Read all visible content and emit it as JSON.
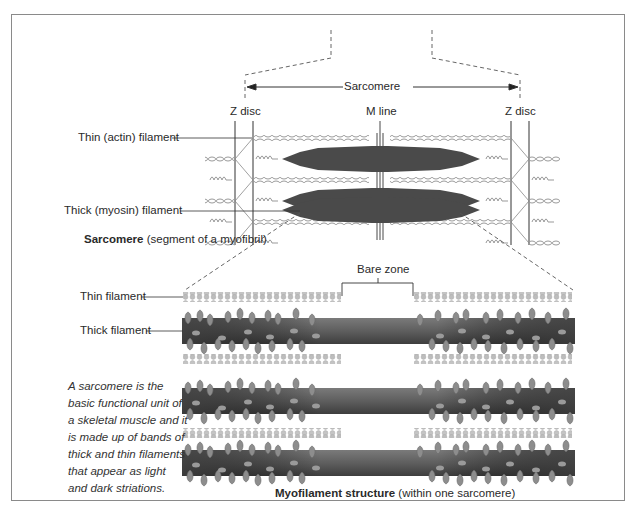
{
  "sarcomere_diagram": {
    "span_label": "Sarcomere",
    "z_disc_left": "Z disc",
    "z_disc_right": "Z disc",
    "m_line": "M line",
    "thin_label": "Thin (actin) filament",
    "thick_label": "Thick (myosin) filament",
    "caption_bold": "Sarcomere",
    "caption_rest": " (segment of a myofibril)"
  },
  "myofilament_diagram": {
    "bare_zone": "Bare zone",
    "thin_label": "Thin filament",
    "thick_label": "Thick filament",
    "caption_bold": "Myofilament structure",
    "caption_rest": " (within one sarcomere)"
  },
  "note": "A sarcomere is the basic functional unit of a skeletal muscle and it is made up of bands of thick and thin filaments that appear as light and dark striations.",
  "colors": {
    "frame": "#8a8a8a",
    "thick_dark": "#4a4a4a",
    "thin_light": "#b5b5b5",
    "myosin_bar": "#5a5a5a"
  }
}
